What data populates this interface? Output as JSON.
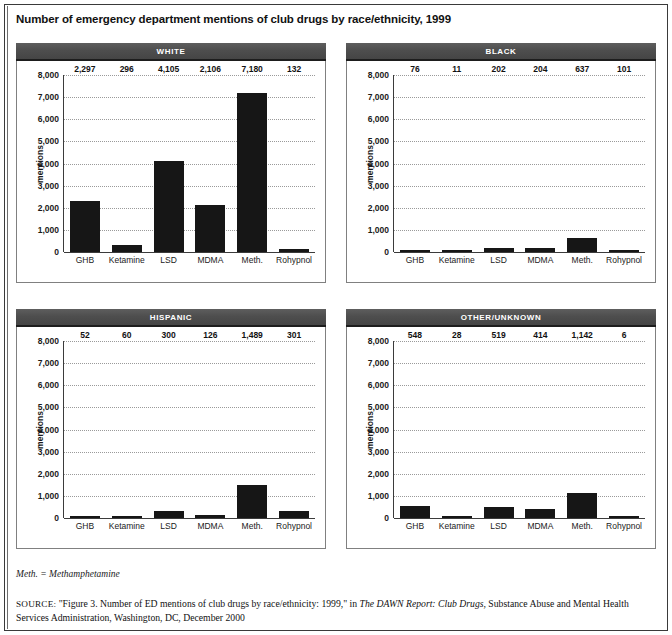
{
  "figure": {
    "title": "Number of emergency department mentions of club drugs by race/ethnicity, 1999",
    "note": "Meth. = Methamphetamine",
    "source_lead": "SOURCE:",
    "source_part1": " \"Figure 3. Number of ED mentions of club drugs by race/ethnicity: 1999,\" in ",
    "source_italic": "The DAWN Report: Club Drugs",
    "source_part2": ", Substance Abuse and Mental Health Services Administration, Washington, DC, December 2000"
  },
  "axis": {
    "ylabel": "mentions",
    "yticks": [
      "8,000",
      "7,000",
      "6,000",
      "5,000",
      "4,000",
      "3,000",
      "2,000",
      "1,000",
      "0"
    ],
    "ymax": 8000,
    "ymin": 0
  },
  "chart_data": [
    {
      "type": "bar",
      "title": "WHITE",
      "categories": [
        "GHB",
        "Ketamine",
        "LSD",
        "MDMA",
        "Meth.",
        "Rohypnol"
      ],
      "values": [
        2297,
        296,
        4105,
        2106,
        7180,
        132
      ],
      "labels": [
        "2,297",
        "296",
        "4,105",
        "2,106",
        "7,180",
        "132"
      ],
      "xlabel": "",
      "ylabel": "mentions",
      "ylim": [
        0,
        8000
      ],
      "grid": true,
      "legend": "none"
    },
    {
      "type": "bar",
      "title": "BLACK",
      "categories": [
        "GHB",
        "Ketamine",
        "LSD",
        "MDMA",
        "Meth.",
        "Rohypnol"
      ],
      "values": [
        76,
        11,
        202,
        204,
        637,
        101
      ],
      "labels": [
        "76",
        "11",
        "202",
        "204",
        "637",
        "101"
      ],
      "xlabel": "",
      "ylabel": "mentions",
      "ylim": [
        0,
        8000
      ],
      "grid": true,
      "legend": "none"
    },
    {
      "type": "bar",
      "title": "HISPANIC",
      "categories": [
        "GHB",
        "Ketamine",
        "LSD",
        "MDMA",
        "Meth.",
        "Rohypnol"
      ],
      "values": [
        52,
        60,
        300,
        126,
        1489,
        301
      ],
      "labels": [
        "52",
        "60",
        "300",
        "126",
        "1,489",
        "301"
      ],
      "xlabel": "",
      "ylabel": "mentions",
      "ylim": [
        0,
        8000
      ],
      "grid": true,
      "legend": "none"
    },
    {
      "type": "bar",
      "title": "OTHER/UNKNOWN",
      "categories": [
        "GHB",
        "Ketamine",
        "LSD",
        "MDMA",
        "Meth.",
        "Rohypnol"
      ],
      "values": [
        548,
        28,
        519,
        414,
        1142,
        6
      ],
      "labels": [
        "548",
        "28",
        "519",
        "414",
        "1,142",
        "6"
      ],
      "xlabel": "",
      "ylabel": "mentions",
      "ylim": [
        0,
        8000
      ],
      "grid": true,
      "legend": "none"
    }
  ],
  "colors": {
    "bar": "#161616",
    "header_bg": "#4e4e4e",
    "header_text": "#ffffff",
    "grid": "#9a9a9a",
    "axis": "#3b3b3b"
  }
}
